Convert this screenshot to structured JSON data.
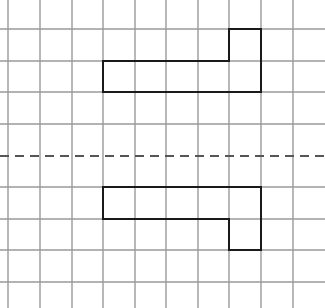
{
  "diagram": {
    "type": "grid-reflection",
    "width": 325,
    "height": 308,
    "grid": {
      "vertical_lines_x": [
        8,
        40,
        72,
        103,
        135,
        166,
        198,
        229,
        261,
        293
      ],
      "horizontal_lines_y": [
        29,
        61,
        92,
        124,
        187,
        219,
        250,
        282
      ],
      "line_color": "#9a9a9a",
      "line_width": 1.4
    },
    "mirror_line": {
      "y": 156,
      "style": "dashed",
      "color": "#555555",
      "dash": "9,6"
    },
    "shapes": [
      {
        "name": "original-shape",
        "points": [
          [
            103,
            61
          ],
          [
            229,
            61
          ],
          [
            229,
            29
          ],
          [
            261,
            29
          ],
          [
            261,
            92
          ],
          [
            103,
            92
          ]
        ],
        "stroke": "#1a1a1a",
        "stroke_width": 2
      },
      {
        "name": "reflected-shape",
        "points": [
          [
            103,
            187
          ],
          [
            261,
            187
          ],
          [
            261,
            250
          ],
          [
            229,
            250
          ],
          [
            229,
            219
          ],
          [
            103,
            219
          ]
        ],
        "stroke": "#1a1a1a",
        "stroke_width": 2
      }
    ]
  }
}
